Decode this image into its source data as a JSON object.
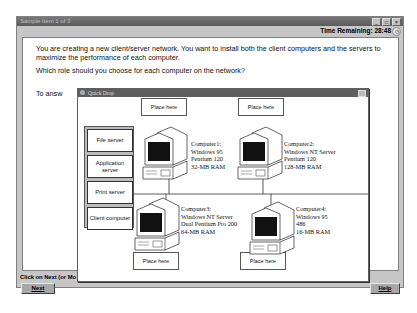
{
  "window": {
    "title": "Sample Item 1 of 3",
    "controls": [
      "minimize",
      "maximize",
      "close"
    ],
    "time_remaining_label": "Time Remaining:",
    "time_remaining_value": "28:48"
  },
  "question": {
    "paragraph1": "You are creating a new client/server network. You want to install both the client computers and the servers to maximize the performance of each computer.",
    "paragraph2": "Which role should you choose for each computer on the network?",
    "paragraph3_partial": "To answ"
  },
  "status": {
    "instruction_partial": "Click on Next (or Mo"
  },
  "buttons": {
    "next_label": "Next",
    "help_label": "Help"
  },
  "quick_drop": {
    "title": "Quick Drop",
    "palette_items": [
      {
        "label": "File server"
      },
      {
        "label": "Application server"
      },
      {
        "label": "Print server"
      },
      {
        "label": "Client computer"
      }
    ],
    "drop_target_label": "Place here",
    "computers": [
      {
        "name": "Computer1:",
        "os": "Windows 95",
        "cpu": "Pentium 120",
        "ram": "32-MB RAM"
      },
      {
        "name": "Computer2:",
        "os": "Windows NT Server",
        "cpu": "Pentium 120",
        "ram": "128-MB RAM"
      },
      {
        "name": "Computer3:",
        "os": "Windows NT Server",
        "cpu": "Dual Pentium Pro 200",
        "ram": "64-MB RAM"
      },
      {
        "name": "Computer4:",
        "os": "Windows 95",
        "cpu": "486",
        "ram": "16-MB RAM"
      }
    ]
  }
}
